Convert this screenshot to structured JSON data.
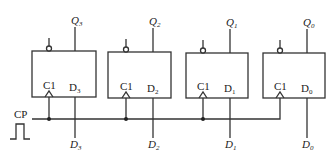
{
  "diagram": {
    "type": "4-bit parallel register (D flip-flops)",
    "clock_label": "CP",
    "flipflops": [
      {
        "id": "ff3",
        "clock_pin": "C1",
        "data_pin": "D",
        "data_sub": "3",
        "output": "Q",
        "output_sub": "3",
        "input": "D",
        "input_sub": "3"
      },
      {
        "id": "ff2",
        "clock_pin": "C1",
        "data_pin": "D",
        "data_sub": "2",
        "output": "Q",
        "output_sub": "2",
        "input": "D",
        "input_sub": "2"
      },
      {
        "id": "ff1",
        "clock_pin": "C1",
        "data_pin": "D",
        "data_sub": "1",
        "output": "Q",
        "output_sub": "1",
        "input": "D",
        "input_sub": "1"
      },
      {
        "id": "ff0",
        "clock_pin": "C1",
        "data_pin": "D",
        "data_sub": "0",
        "output": "Q",
        "output_sub": "0",
        "input": "D",
        "input_sub": "0"
      }
    ]
  }
}
